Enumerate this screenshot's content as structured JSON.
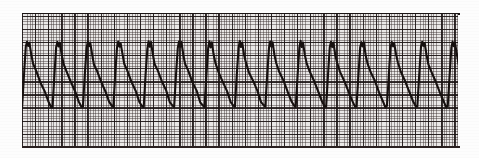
{
  "document": {
    "kind": "ecg-rhythm-strip",
    "title": "ECG Rhythm Strip",
    "caption": ""
  },
  "paper": {
    "background_color": "#e9e7e6",
    "page_color": "#fdfdfd",
    "fine_grid_color": "#372d2d",
    "bold_grid_color": "#191212",
    "fine_grid_spacing_px": 2.62,
    "bold_grid_spacing_px": 13.1,
    "border_color": "#1a1414",
    "strip_left_px": 22,
    "strip_top_px": 14,
    "strip_width_px": 436,
    "strip_height_px": 134
  },
  "trace": {
    "color": "#16100f",
    "stroke_width_px": 2.1,
    "beat_count": 14,
    "peak_y_px": 28,
    "trough_y_px": 93,
    "beat_spacing_px": 30.4,
    "first_peak_x_px": 5,
    "morphology": "notched-peak-sawtooth",
    "peaks_x_px": [
      5,
      35,
      66,
      96,
      127,
      157,
      188,
      218,
      248,
      279,
      309,
      340,
      370,
      401
    ],
    "troughs_x_px": [
      24,
      54,
      85,
      115,
      146,
      176,
      206,
      237,
      267,
      298,
      328,
      359,
      389,
      420
    ]
  },
  "chart_data": {
    "type": "line",
    "title": "ECG Rhythm Strip",
    "xlabel": "",
    "ylabel": "",
    "grid": true,
    "legend": "none",
    "xlim": [
      0,
      436
    ],
    "ylim": [
      134,
      0
    ],
    "series": [
      {
        "name": "ecg-trace",
        "color": "#16100f",
        "beat_count": 14,
        "beat_spacing_px": 30.4,
        "peak_amplitude_px": 65,
        "points_per_beat": [
          {
            "t": 0.0,
            "y": 93
          },
          {
            "t": 0.06,
            "y": 62
          },
          {
            "t": 0.12,
            "y": 34
          },
          {
            "t": 0.16,
            "y": 28
          },
          {
            "t": 0.2,
            "y": 33
          },
          {
            "t": 0.24,
            "y": 29
          },
          {
            "t": 0.3,
            "y": 41
          },
          {
            "t": 0.36,
            "y": 50
          },
          {
            "t": 0.46,
            "y": 58
          },
          {
            "t": 0.6,
            "y": 68
          },
          {
            "t": 0.74,
            "y": 78
          },
          {
            "t": 0.86,
            "y": 88
          },
          {
            "t": 0.95,
            "y": 93
          },
          {
            "t": 1.0,
            "y": 93
          }
        ]
      }
    ]
  }
}
